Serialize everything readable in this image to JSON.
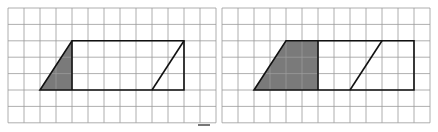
{
  "figure": {
    "panels": [
      {
        "id": "left",
        "grid": {
          "cols": 13,
          "rows": 7,
          "x": 8,
          "y": 8,
          "cell_w": 16,
          "cell_h": 16.4
        },
        "outline": [
          [
            4,
            2
          ],
          [
            11,
            2
          ],
          [
            11,
            5
          ],
          [
            2,
            5
          ]
        ],
        "inner_line": [
          [
            9,
            5
          ],
          [
            11,
            2
          ]
        ],
        "divider": [
          [
            4,
            2
          ],
          [
            4,
            5
          ]
        ],
        "shaded": [
          [
            2,
            5
          ],
          [
            4,
            2
          ],
          [
            4,
            5
          ]
        ]
      },
      {
        "id": "right",
        "grid": {
          "cols": 13,
          "rows": 7,
          "x": 222,
          "y": 8,
          "cell_w": 16,
          "cell_h": 16.4
        },
        "outline": [
          [
            4,
            2
          ],
          [
            12,
            2
          ],
          [
            12,
            5
          ],
          [
            2,
            5
          ]
        ],
        "inner_line": [
          [
            8,
            5
          ],
          [
            10,
            2
          ]
        ],
        "divider": [
          [
            6,
            2
          ],
          [
            6,
            5
          ]
        ],
        "shaded": [
          [
            2,
            5
          ],
          [
            4,
            2
          ],
          [
            6,
            2
          ],
          [
            6,
            5
          ]
        ]
      }
    ],
    "colors": {
      "grid": "#9a9a9a",
      "outline": "#111111",
      "shade": "#7a7a7a"
    }
  }
}
